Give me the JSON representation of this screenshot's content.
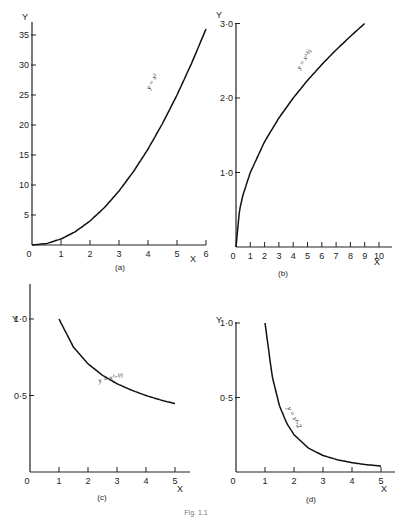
{
  "figure_caption": "Fig. 1.1",
  "chart_data": [
    {
      "type": "line",
      "panel": "(a)",
      "title": "",
      "curve_label": "y = x²",
      "xlabel": "X",
      "ylabel": "Y",
      "xlim": [
        0,
        6
      ],
      "ylim": [
        0,
        37
      ],
      "xticks": [
        "0",
        "1",
        "2",
        "3",
        "4",
        "5",
        "6"
      ],
      "yticks": [
        "5",
        "10",
        "15",
        "20",
        "25",
        "30",
        "35"
      ],
      "grid": false,
      "x": [
        0,
        0.5,
        1,
        1.5,
        2,
        2.5,
        3,
        3.5,
        4,
        4.5,
        5,
        5.5,
        6
      ],
      "values": [
        0,
        0.25,
        1,
        2.25,
        4,
        6.25,
        9,
        12.25,
        16,
        20.25,
        25,
        30.25,
        36
      ]
    },
    {
      "type": "line",
      "panel": "(b)",
      "title": "",
      "curve_label": "y = x^½",
      "xlabel": "X",
      "ylabel": "Y",
      "xlim": [
        0,
        10.5
      ],
      "ylim": [
        0,
        3.0
      ],
      "xticks": [
        "0",
        "1",
        "2",
        "3",
        "4",
        "5",
        "6",
        "7",
        "8",
        "9",
        "10"
      ],
      "yticks": [
        "1·0",
        "2·0",
        "3·0"
      ],
      "grid": false,
      "x": [
        0,
        0.25,
        0.5,
        1,
        2,
        3,
        4,
        5,
        6,
        7,
        8,
        9
      ],
      "values": [
        0,
        0.5,
        0.707,
        1,
        1.414,
        1.732,
        2,
        2.236,
        2.449,
        2.646,
        2.828,
        3
      ]
    },
    {
      "type": "line",
      "panel": "(c)",
      "title": "",
      "curve_label": "y = x^-½",
      "xlabel": "X",
      "ylabel": "Y",
      "xlim": [
        0,
        5.5
      ],
      "ylim": [
        0,
        1.2
      ],
      "xticks": [
        "0",
        "1",
        "2",
        "3",
        "4",
        "5"
      ],
      "yticks": [
        "0·5",
        "1·0"
      ],
      "grid": false,
      "x": [
        1,
        1.5,
        2,
        2.5,
        3,
        3.5,
        4,
        4.5,
        5
      ],
      "values": [
        1,
        0.816,
        0.707,
        0.632,
        0.577,
        0.535,
        0.5,
        0.471,
        0.447
      ]
    },
    {
      "type": "line",
      "panel": "(d)",
      "title": "",
      "curve_label": "y = x^-2",
      "xlabel": "X",
      "ylabel": "Y",
      "xlim": [
        0,
        5.5
      ],
      "ylim": [
        0,
        1.0
      ],
      "xticks": [
        "0",
        "1",
        "2",
        "3",
        "4",
        "5"
      ],
      "yticks": [
        "0·5",
        "1·0"
      ],
      "grid": false,
      "x": [
        1,
        1.25,
        1.5,
        1.75,
        2,
        2.5,
        3,
        3.5,
        4,
        4.5,
        5
      ],
      "values": [
        1,
        0.64,
        0.444,
        0.327,
        0.25,
        0.16,
        0.111,
        0.082,
        0.0625,
        0.049,
        0.04
      ]
    }
  ]
}
